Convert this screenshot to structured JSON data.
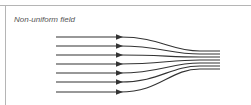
{
  "figure": {
    "title": "Non-uniform field",
    "line_color": "#333333",
    "field_lines": [
      {
        "y_start": 37,
        "y_end": 51
      },
      {
        "y_start": 46,
        "y_end": 54
      },
      {
        "y_start": 55,
        "y_end": 57
      },
      {
        "y_start": 64,
        "y_end": 60
      },
      {
        "y_start": 73,
        "y_end": 63
      },
      {
        "y_start": 82,
        "y_end": 66
      },
      {
        "y_start": 92,
        "y_end": 69
      }
    ]
  }
}
